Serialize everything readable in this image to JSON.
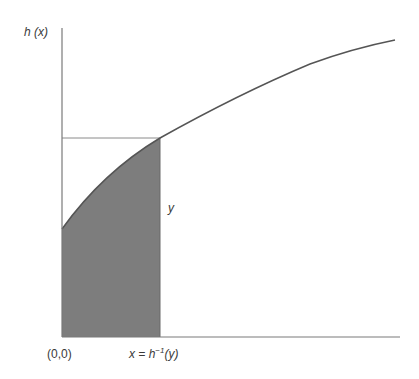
{
  "diagram": {
    "y_axis_label": "h (x)",
    "origin_label": "(0,0)",
    "x_point_label_prefix": "x = h",
    "x_point_label_sup": "−1",
    "x_point_label_suffix": "(y)",
    "segment_label": "y",
    "curve_name": "h(x)",
    "shaded_region": "area under h(x) from 0 to h^-1(y)",
    "colors": {
      "axis": "#7a7a7a",
      "curve": "#555555",
      "shade": "#7d7d7d",
      "guide_line": "#8a8a8a",
      "text": "#3a3a3a"
    }
  }
}
